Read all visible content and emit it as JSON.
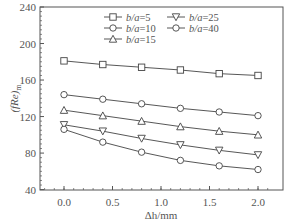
{
  "chart_data": {
    "type": "line",
    "title": "",
    "xlabel": "Δh/mm",
    "ylabel": "(fRe)m",
    "xlim": [
      -0.25,
      2.25
    ],
    "ylim": [
      40,
      240
    ],
    "x_ticks": [
      "0.0",
      "0.5",
      "1.0",
      "1.5",
      "2.0"
    ],
    "y_ticks": [
      "40",
      "80",
      "120",
      "160",
      "200",
      "240"
    ],
    "grid": false,
    "legend_position": "top-right",
    "x": [
      0.0,
      0.4,
      0.8,
      1.2,
      1.6,
      2.0
    ],
    "series": [
      {
        "name": "b/a=5",
        "marker": "square",
        "values": [
          181,
          177,
          174,
          171,
          167,
          165
        ]
      },
      {
        "name": "b/a=10",
        "marker": "circle",
        "values": [
          144,
          139,
          134,
          129,
          125,
          121
        ]
      },
      {
        "name": "b/a=15",
        "marker": "triangle-up",
        "values": [
          127,
          121,
          115,
          109,
          104,
          100
        ]
      },
      {
        "name": "b/a=25",
        "marker": "triangle-down",
        "values": [
          111,
          104,
          96,
          89,
          83,
          78
        ]
      },
      {
        "name": "b/a=40",
        "marker": "circle",
        "values": [
          106,
          92,
          81,
          72,
          66,
          62
        ]
      }
    ]
  },
  "legend": {
    "items": [
      "b/a=5",
      "b/a=10",
      "b/a=15",
      "b/a=25",
      "b/a=40"
    ]
  },
  "axes": {
    "xlabel": "Δh/mm",
    "ylabel_main": "(fRe)",
    "ylabel_sub": "m"
  }
}
